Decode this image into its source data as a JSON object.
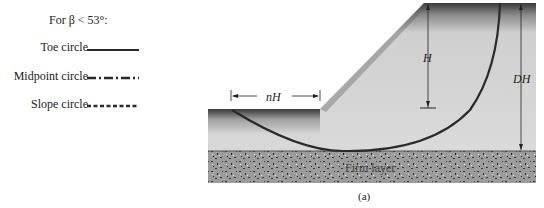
{
  "legend": {
    "title": "For β < 53°:",
    "items": [
      {
        "label": "Toe circle",
        "style": "solid"
      },
      {
        "label": "Midpoint circle",
        "style": "dash-dot"
      },
      {
        "label": "Slope circle",
        "style": "dashed"
      }
    ]
  },
  "diagram": {
    "labels": {
      "nH": "nH",
      "H": "H",
      "DH": "DH",
      "firm_layer": "Firm layer"
    },
    "colors": {
      "soil": "#d6d6d6",
      "firm_layer": "#9a9a9a",
      "circle": "#2a2a2a"
    }
  },
  "caption": "(a)"
}
